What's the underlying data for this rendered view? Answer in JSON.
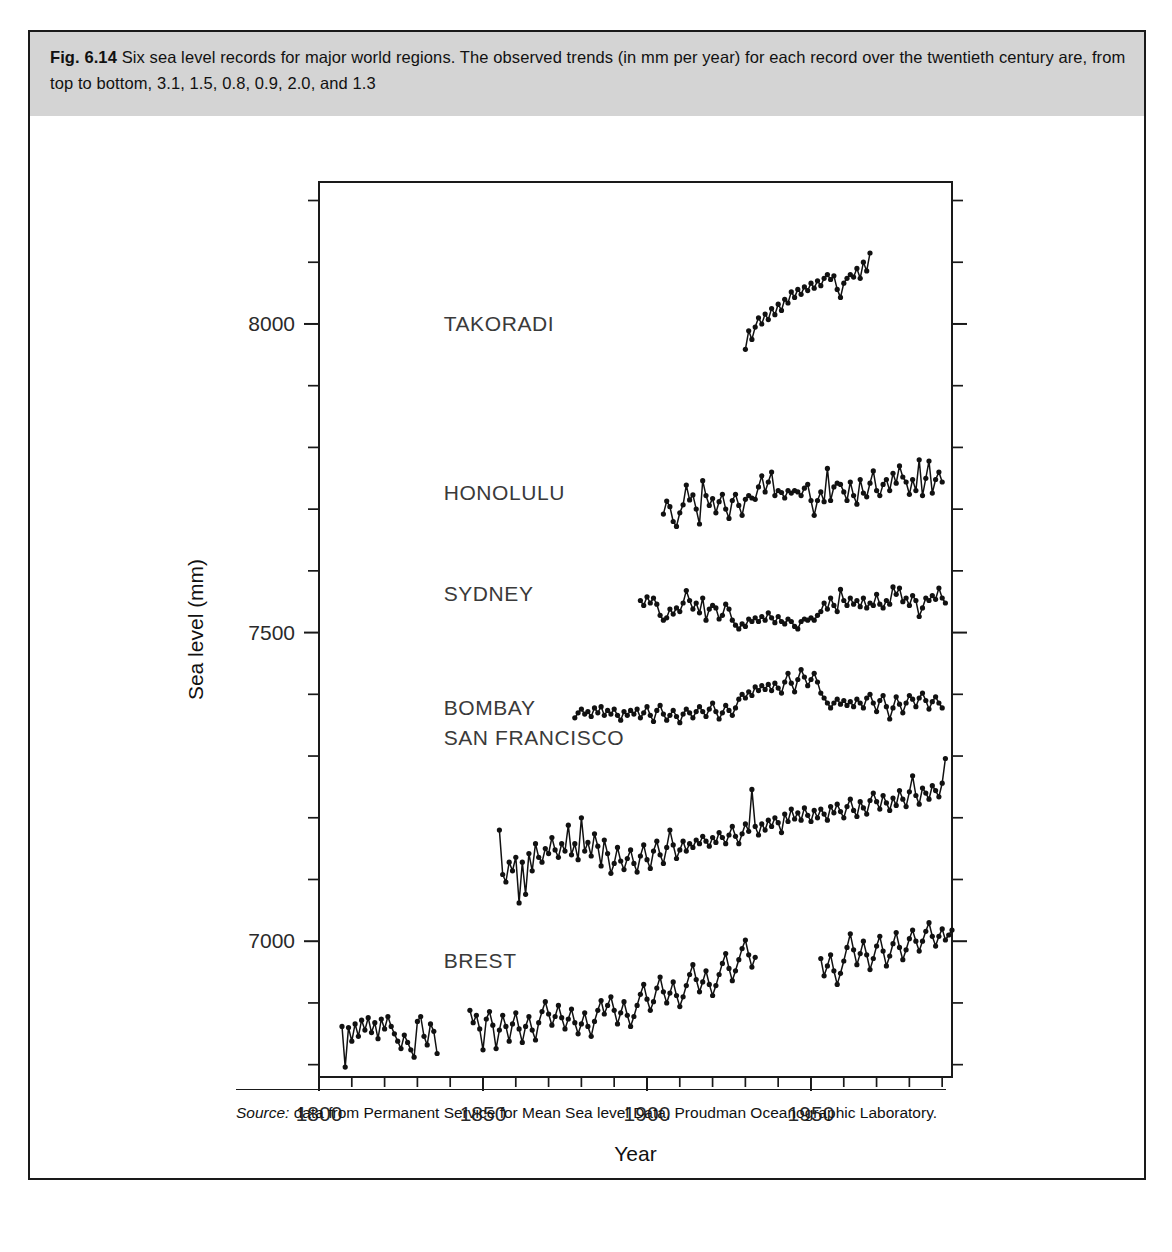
{
  "figure": {
    "number": "Fig. 6.14",
    "caption": "Six sea level records for major world regions. The observed trends (in mm per year) for each record over the twentieth century are, from top to bottom, 3.1, 1.5, 0.8, 0.9, 2.0, and 1.3",
    "source_prefix": "Source:",
    "source_text": "data from Permanent Service for Mean Sea level Data, Proudman Oceanographic Laboratory."
  },
  "chart_data": {
    "type": "line",
    "title": "Six sea level records for major world regions",
    "xlabel": "Year",
    "ylabel": "Sea level (mm)",
    "xlim": [
      1800,
      1993
    ],
    "ylim": [
      6780,
      8230
    ],
    "grid": false,
    "legend": "inline-labels",
    "xticks_major": [
      1800,
      1850,
      1900,
      1950
    ],
    "xticks_major_labels": [
      "1800",
      "1850",
      "1900",
      "1950"
    ],
    "xtick_minor_step": 10,
    "yticks_major": [
      7000,
      7500,
      8000
    ],
    "yticks_major_labels": [
      "7000",
      "7500",
      "8000"
    ],
    "ytick_minor_step": 100,
    "trends_mm_per_year": [
      3.1,
      1.5,
      0.8,
      0.9,
      2.0,
      1.3
    ],
    "series": [
      {
        "name": "TAKORADI",
        "trend_mm_per_year": 3.1,
        "label_x": 1838,
        "label_y": 8000,
        "x0": 1930,
        "values": [
          7959,
          7989,
          7975,
          7995,
          8010,
          8000,
          8016,
          8007,
          8025,
          8015,
          8032,
          8022,
          8040,
          8034,
          8052,
          8043,
          8056,
          8048,
          8060,
          8054,
          8066,
          8058,
          8070,
          8062,
          8074,
          8080,
          8072,
          8078,
          8056,
          8043,
          8066,
          8074,
          8080,
          8076,
          8090,
          8074,
          8100,
          8086,
          8115
        ]
      },
      {
        "name": "HONOLULU",
        "trend_mm_per_year": 1.5,
        "label_x": 1838,
        "label_y": 7726,
        "x0": 1905,
        "values": [
          7692,
          7713,
          7704,
          7680,
          7672,
          7694,
          7707,
          7739,
          7715,
          7723,
          7700,
          7676,
          7746,
          7722,
          7706,
          7717,
          7694,
          7712,
          7724,
          7700,
          7685,
          7714,
          7724,
          7706,
          7690,
          7716,
          7722,
          7718,
          7716,
          7736,
          7754,
          7728,
          7744,
          7760,
          7722,
          7730,
          7727,
          7718,
          7730,
          7726,
          7730,
          7728,
          7722,
          7734,
          7740,
          7714,
          7690,
          7714,
          7728,
          7712,
          7766,
          7714,
          7736,
          7742,
          7740,
          7728,
          7714,
          7744,
          7722,
          7708,
          7748,
          7726,
          7720,
          7742,
          7762,
          7730,
          7722,
          7740,
          7748,
          7730,
          7758,
          7742,
          7770,
          7752,
          7744,
          7724,
          7748,
          7730,
          7780,
          7722,
          7750,
          7778,
          7726,
          7748,
          7760,
          7744
        ]
      },
      {
        "name": "SYDNEY",
        "trend_mm_per_year": 0.8,
        "label_x": 1838,
        "label_y": 7563,
        "x0": 1898,
        "values": [
          7552,
          7544,
          7558,
          7548,
          7556,
          7546,
          7528,
          7520,
          7524,
          7538,
          7530,
          7540,
          7534,
          7548,
          7568,
          7552,
          7538,
          7548,
          7532,
          7556,
          7520,
          7538,
          7544,
          7540,
          7522,
          7528,
          7546,
          7538,
          7520,
          7512,
          7506,
          7514,
          7510,
          7522,
          7518,
          7524,
          7518,
          7526,
          7520,
          7532,
          7524,
          7516,
          7526,
          7518,
          7514,
          7522,
          7518,
          7510,
          7506,
          7518,
          7522,
          7520,
          7524,
          7520,
          7528,
          7534,
          7548,
          7538,
          7556,
          7544,
          7534,
          7570,
          7552,
          7544,
          7556,
          7546,
          7552,
          7542,
          7556,
          7540,
          7548,
          7544,
          7562,
          7546,
          7540,
          7552,
          7546,
          7574,
          7562,
          7572,
          7550,
          7556,
          7544,
          7560,
          7552,
          7526,
          7540,
          7556,
          7552,
          7560,
          7554,
          7572,
          7556,
          7548
        ]
      },
      {
        "name": "BOMBAY",
        "trend_mm_per_year": 0.9,
        "label_x": 1838,
        "label_y": 7378,
        "x0": 1878,
        "values": [
          7362,
          7370,
          7376,
          7368,
          7372,
          7364,
          7378,
          7370,
          7380,
          7366,
          7374,
          7368,
          7376,
          7366,
          7358,
          7372,
          7366,
          7374,
          7368,
          7376,
          7362,
          7370,
          7380,
          7366,
          7356,
          7374,
          7382,
          7368,
          7358,
          7366,
          7374,
          7364,
          7354,
          7368,
          7376,
          7370,
          7362,
          7372,
          7380,
          7372,
          7364,
          7376,
          7386,
          7372,
          7360,
          7370,
          7382,
          7374,
          7366,
          7378,
          7392,
          7400,
          7394,
          7404,
          7398,
          7412,
          7406,
          7414,
          7408,
          7416,
          7406,
          7418,
          7410,
          7402,
          7420,
          7434,
          7418,
          7404,
          7424,
          7440,
          7428,
          7414,
          7424,
          7434,
          7420,
          7402,
          7394,
          7386,
          7378,
          7386,
          7392,
          7384,
          7390,
          7382,
          7388,
          7380,
          7392,
          7386,
          7378,
          7394,
          7400,
          7386,
          7372,
          7390,
          7398,
          7380,
          7360,
          7378,
          7396,
          7384,
          7370,
          7386,
          7398,
          7392,
          7380,
          7394,
          7402,
          7390,
          7376,
          7388,
          7396,
          7386,
          7378
        ]
      },
      {
        "name": "SAN FRANCISCO",
        "trend_mm_per_year": 2.0,
        "label_x": 1838,
        "label_y": 7330,
        "x0": 1855,
        "values": [
          7180,
          7108,
          7096,
          7128,
          7114,
          7136,
          7062,
          7128,
          7076,
          7142,
          7114,
          7158,
          7136,
          7128,
          7150,
          7142,
          7168,
          7148,
          7136,
          7158,
          7146,
          7188,
          7140,
          7158,
          7132,
          7200,
          7146,
          7160,
          7138,
          7174,
          7154,
          7122,
          7164,
          7142,
          7110,
          7126,
          7152,
          7130,
          7116,
          7134,
          7148,
          7126,
          7112,
          7138,
          7156,
          7132,
          7118,
          7146,
          7162,
          7140,
          7126,
          7152,
          7180,
          7156,
          7134,
          7148,
          7162,
          7146,
          7158,
          7152,
          7164,
          7158,
          7170,
          7162,
          7154,
          7168,
          7160,
          7176,
          7168,
          7158,
          7172,
          7186,
          7170,
          7158,
          7174,
          7190,
          7178,
          7246,
          7186,
          7172,
          7190,
          7180,
          7196,
          7186,
          7200,
          7192,
          7176,
          7206,
          7194,
          7214,
          7198,
          7208,
          7196,
          7216,
          7204,
          7194,
          7212,
          7200,
          7214,
          7206,
          7196,
          7218,
          7208,
          7222,
          7210,
          7200,
          7218,
          7230,
          7212,
          7202,
          7226,
          7216,
          7206,
          7228,
          7240,
          7226,
          7214,
          7236,
          7224,
          7212,
          7232,
          7220,
          7244,
          7230,
          7218,
          7242,
          7268,
          7236,
          7222,
          7248,
          7240,
          7230,
          7252,
          7244,
          7234,
          7256,
          7296
        ]
      },
      {
        "name": "BREST",
        "trend_mm_per_year": 1.3,
        "label_x": 1838,
        "label_y": 6968,
        "segments": [
          {
            "x0": 1807,
            "values": [
              6862,
              6796,
              6860,
              6838,
              6866,
              6846,
              6872,
              6856,
              6876,
              6852,
              6868,
              6842,
              6874,
              6858,
              6878,
              6862,
              6850,
              6838,
              6826,
              6848,
              6836,
              6824,
              6812,
              6870,
              6878,
              6846,
              6832,
              6866,
              6854,
              6818
            ]
          },
          {
            "x0": 1846,
            "values": [
              6888,
              6868,
              6880,
              6858,
              6824,
              6874,
              6886,
              6864,
              6826,
              6856,
              6880,
              6862,
              6838,
              6866,
              6884,
              6858,
              6836,
              6862,
              6878,
              6856,
              6840,
              6868,
              6886,
              6902,
              6882,
              6864,
              6878,
              6896,
              6876,
              6858,
              6874,
              6890,
              6868,
              6850,
              6866,
              6884,
              6862,
              6846,
              6870,
              6888,
              6904,
              6882,
              6896,
              6910,
              6888,
              6866,
              6884,
              6902,
              6880,
              6862,
              6878,
              6896,
              6914,
              6930,
              6906,
              6888,
              6902,
              6924,
              6942,
              6918,
              6900,
              6916,
              6934,
              6912,
              6894,
              6910,
              6928,
              6946,
              6962,
              6938,
              6918,
              6934,
              6952,
              6930,
              6912,
              6928,
              6946,
              6964,
              6980,
              6956,
              6936,
              6952,
              6970,
              6988,
              7002,
              6978,
              6958,
              6974
            ]
          },
          {
            "x0": 1953,
            "values": [
              6972,
              6944,
              6960,
              6978,
              6952,
              6930,
              6948,
              6968,
              6990,
              7012,
              6986,
              6962,
              6980,
              7000,
              6978,
              6954,
              6972,
              6992,
              7008,
              6984,
              6960,
              6976,
              6996,
              7014,
              6990,
              6970,
              6986,
              7004,
              7018,
              7000,
              6984,
              7000,
              7016,
              7030,
              7008,
              6992,
              7008,
              7020,
              7002,
              7010,
              7018
            ]
          }
        ]
      }
    ]
  }
}
